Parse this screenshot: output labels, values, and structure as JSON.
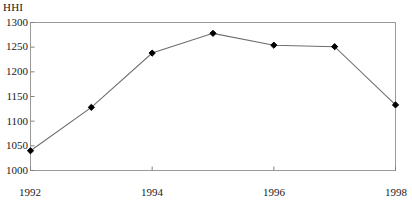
{
  "chart_data": {
    "type": "line",
    "title": "",
    "subtitle": "",
    "xlabel": "",
    "ylabel": "HHI",
    "x": [
      1992,
      1993,
      1994,
      1995,
      1996,
      1997,
      1998
    ],
    "values": [
      1040,
      1128,
      1238,
      1278,
      1254,
      1251,
      1133
    ],
    "series": [
      {
        "name": "HHI",
        "values": [
          1040,
          1128,
          1238,
          1278,
          1254,
          1251,
          1133
        ]
      }
    ],
    "xlim": [
      1992,
      1998
    ],
    "ylim": [
      1000,
      1300
    ],
    "ytick_labels": [
      "1300",
      "1250",
      "1200",
      "1150",
      "1100",
      "1050",
      "1000"
    ],
    "ytick_values": [
      1300,
      1250,
      1200,
      1150,
      1100,
      1050,
      1000
    ],
    "xtick_labels": [
      "1992",
      "1994",
      "1996",
      "1998"
    ],
    "xtick_values": [
      1992,
      1994,
      1996,
      1998
    ],
    "grid": false,
    "legend": false,
    "legend_position": "none",
    "marker": "diamond",
    "line_color": "#6e6e6e",
    "marker_color": "#000000",
    "axis_color": "#808080",
    "frame": "box"
  }
}
